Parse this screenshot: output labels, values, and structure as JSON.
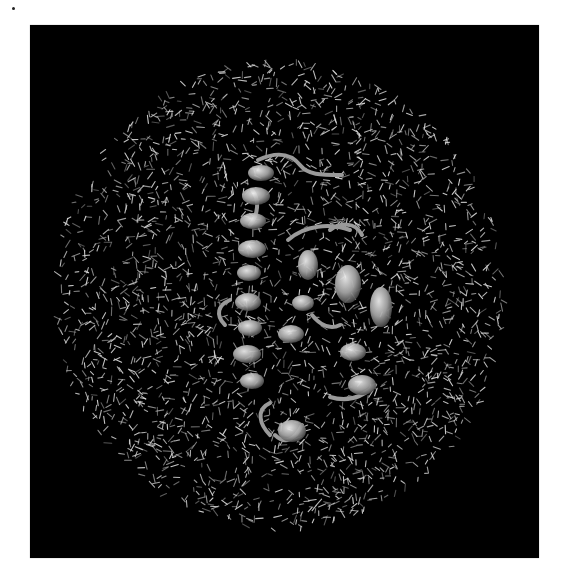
{
  "figure": {
    "background_color": "#000000",
    "page_color": "#ffffff",
    "panel": {
      "x": 30,
      "y": 25,
      "width": 509,
      "height": 533
    },
    "water_box": {
      "representation": "lines",
      "color": "#d8d8d8",
      "center": [
        250,
        270
      ],
      "radius_x": 225,
      "radius_y": 235,
      "count": 2600,
      "stick_length": 7,
      "seed": 7
    },
    "protein": {
      "representation": "new-cartoon",
      "color": "#c8c8c8",
      "helices": [
        {
          "x": 218,
          "y": 140,
          "w": 26,
          "h": 16
        },
        {
          "x": 212,
          "y": 162,
          "w": 28,
          "h": 18
        },
        {
          "x": 210,
          "y": 188,
          "w": 26,
          "h": 16
        },
        {
          "x": 208,
          "y": 215,
          "w": 28,
          "h": 18
        },
        {
          "x": 207,
          "y": 240,
          "w": 24,
          "h": 16
        },
        {
          "x": 205,
          "y": 268,
          "w": 26,
          "h": 18
        },
        {
          "x": 208,
          "y": 295,
          "w": 24,
          "h": 16
        },
        {
          "x": 203,
          "y": 320,
          "w": 28,
          "h": 18
        },
        {
          "x": 210,
          "y": 348,
          "w": 24,
          "h": 16
        },
        {
          "x": 262,
          "y": 270,
          "w": 22,
          "h": 16
        },
        {
          "x": 248,
          "y": 300,
          "w": 26,
          "h": 18
        },
        {
          "x": 268,
          "y": 225,
          "w": 20,
          "h": 30
        },
        {
          "x": 305,
          "y": 240,
          "w": 26,
          "h": 38
        },
        {
          "x": 340,
          "y": 262,
          "w": 22,
          "h": 40
        },
        {
          "x": 310,
          "y": 318,
          "w": 26,
          "h": 18
        },
        {
          "x": 318,
          "y": 350,
          "w": 28,
          "h": 20
        },
        {
          "x": 248,
          "y": 395,
          "w": 28,
          "h": 22
        }
      ],
      "loops": [
        "M228 135 C 250 125, 262 130, 270 140 S 290 150, 312 150",
        "M258 215 C 275 200, 300 198, 320 205",
        "M300 205 C 310 198, 325 196, 332 210",
        "M240 378 C 225 385, 230 400, 240 410",
        "M245 410 C 255 420, 265 415, 272 400",
        "M300 372 C 320 378, 335 370, 345 360",
        "M222 165 C 230 175, 228 190, 220 200",
        "M195 300 C 185 290, 188 280, 200 275",
        "M282 290 C 290 300, 300 305, 310 300"
      ]
    }
  }
}
